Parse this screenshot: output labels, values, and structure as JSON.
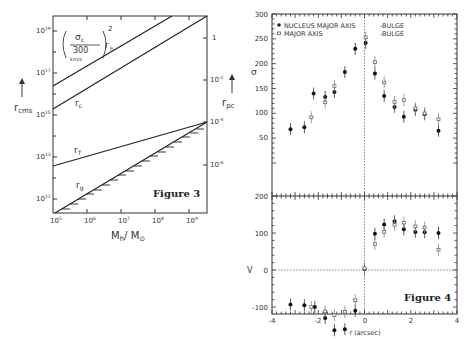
{
  "figure3": {
    "caption": "Figure 3",
    "xlabel": "M_h/M_⊙",
    "ylabel_left": "r_cms",
    "ylabel_right": "r_pc",
    "x_ticks": [
      "10^5",
      "10^6",
      "10^7",
      "10^8",
      "10^9"
    ],
    "y_left_ticks": [
      "10^11",
      "10^13",
      "10^15",
      "10^17",
      "10^19"
    ],
    "y_right_ticks": [
      "10^-6",
      "10^-4",
      "10^-2",
      "1"
    ],
    "curve_labels": {
      "rh": "(σc / 300 km/s)² r_h",
      "rc": "r_c",
      "rT": "r_T",
      "rg": "r_g"
    }
  },
  "figure4": {
    "caption": "Figure 4",
    "xlabel": "r (arcsec)",
    "ylabel_top": "σ",
    "ylabel_bottom": "V",
    "legend": [
      {
        "marker": "filled-circle",
        "label": "NUCLEUS MAJOR AXIS",
        "suffix": "-BULGE"
      },
      {
        "marker": "open-square",
        "label": "MAJOR AXIS",
        "suffix": "-BULGE"
      }
    ]
  },
  "chart_data": [
    {
      "type": "line",
      "title": "Figure 3",
      "xlabel": "M_h / M_⊙",
      "ylabel": "r_cms (left, log)  /  r_pc (right, log)",
      "xscale": "log",
      "yscale": "log",
      "xlim": [
        100000.0,
        3000000000.0
      ],
      "ylim": [
        10000000000.0,
        1e+20
      ],
      "series": [
        {
          "name": "(σc/300 km/s)² r_h",
          "x": [
            100000.0,
            1500000000.0
          ],
          "y": [
            3e+16,
            1e+20
          ]
        },
        {
          "name": "r_c",
          "x": [
            100000.0,
            3000000000.0
          ],
          "y": [
            3000000000000000.0,
            5e+19
          ]
        },
        {
          "name": "r_T",
          "x": [
            100000.0,
            3000000000.0
          ],
          "y": [
            3000000000000.0,
            200000000000000.0
          ]
        },
        {
          "name": "r_g (hatched)",
          "x": [
            100000.0,
            3000000000.0
          ],
          "y": [
            10000000000.0,
            300000000000000.0
          ]
        }
      ]
    },
    {
      "type": "scatter",
      "title": "Figure 4 (top panel)",
      "xlabel": "r (orcsec)",
      "ylabel": "σ",
      "xlim": [
        -4,
        4
      ],
      "ylim": [
        0,
        300
      ],
      "y_ticks": [
        50,
        100,
        150,
        200,
        250,
        300
      ],
      "series": [
        {
          "name": "NUCLEUS MAJOR AXIS",
          "marker": "filled",
          "x": [
            -3.2,
            -2.6,
            -2.2,
            -1.7,
            -1.3,
            -0.85,
            -0.4,
            0.05,
            0.45,
            0.85,
            1.3,
            1.7,
            2.2,
            2.6,
            3.2
          ],
          "y": [
            68,
            72,
            140,
            133,
            143,
            183,
            230,
            242,
            180,
            135,
            113,
            93,
            107,
            98,
            65
          ]
        },
        {
          "name": "MAJOR AXIS",
          "marker": "open",
          "x": [
            -2.3,
            -1.7,
            -1.3,
            0.05,
            0.45,
            0.85,
            1.3,
            1.7,
            2.2,
            2.6,
            3.2
          ],
          "y": [
            92,
            122,
            155,
            253,
            203,
            162,
            123,
            127,
            110,
            100,
            88
          ]
        }
      ]
    },
    {
      "type": "scatter",
      "title": "Figure 4 (bottom panel)",
      "xlabel": "r (orcsec)",
      "ylabel": "V",
      "xlim": [
        -4,
        4
      ],
      "ylim": [
        -200,
        200
      ],
      "x_ticks": [
        -4,
        -2,
        0,
        2,
        4
      ],
      "y_ticks": [
        -200,
        -100,
        0,
        100,
        200
      ],
      "series": [
        {
          "name": "NUCLEUS MAJOR AXIS",
          "marker": "filled",
          "x": [
            -3.2,
            -2.6,
            -2.15,
            -1.7,
            -1.3,
            -0.85,
            -0.4,
            0.0,
            0.45,
            0.85,
            1.3,
            1.7,
            2.2,
            2.6,
            3.2
          ],
          "y": [
            -93,
            -95,
            -100,
            -130,
            -163,
            -160,
            -110,
            3,
            98,
            123,
            132,
            110,
            103,
            102,
            100
          ]
        },
        {
          "name": "MAJOR AXIS",
          "marker": "open",
          "x": [
            -2.3,
            -1.7,
            -1.3,
            -0.85,
            -0.4,
            0.0,
            0.45,
            0.85,
            1.3,
            1.7,
            2.2,
            2.6,
            3.2
          ],
          "y": [
            -100,
            -112,
            -122,
            -113,
            -82,
            5,
            70,
            103,
            122,
            128,
            118,
            115,
            55
          ]
        }
      ]
    }
  ]
}
